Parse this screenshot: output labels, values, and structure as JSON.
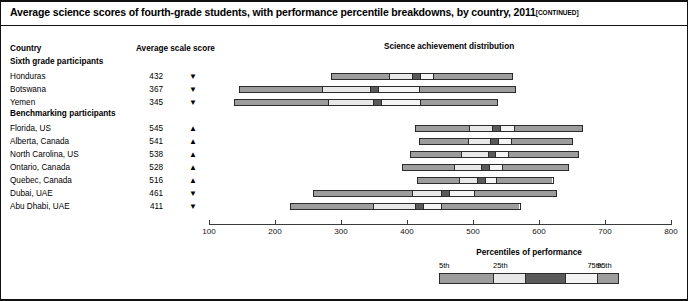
{
  "title": {
    "main": "Average science scores of fourth-grade students, with performance percentile breakdowns, by country, 2011",
    "continued": "[CONTINUED]"
  },
  "columns": {
    "country": "Country",
    "score": "Average scale score",
    "distribution": "Science achievement distribution"
  },
  "groups": [
    {
      "label": "Sixth grade participants"
    },
    {
      "label": "Benchmarking participants"
    }
  ],
  "legend": {
    "title": "Percentiles of performance",
    "labels": [
      "5th",
      "25th",
      "75th",
      "95th"
    ],
    "colors": [
      "#9d9d9d",
      "#e8e8e8",
      "#5a5a5a",
      "#f4f4f4",
      "#9d9d9d"
    ]
  },
  "arrows": {
    "up": "▲",
    "down": "▼"
  },
  "chart_data": {
    "type": "bar",
    "title": "Science achievement distribution",
    "xlabel": "",
    "ylabel": "",
    "xlim": [
      100,
      800
    ],
    "xticks": [
      100,
      200,
      300,
      400,
      500,
      600,
      700,
      800
    ],
    "grid": false,
    "legend_position": "bottom-right",
    "series_note": "Each row is a percentile range bar: 5th, 25th, 75th, 95th percentile boundaries around the average scale score.",
    "rows": [
      {
        "group": "Sixth grade participants",
        "country": "Honduras",
        "score": 432,
        "arrow": "down",
        "p5": 285,
        "p25": 372,
        "p50": 413,
        "p75": 440,
        "p95": 560
      },
      {
        "group": "Sixth grade participants",
        "country": "Botswana",
        "score": 367,
        "arrow": "down",
        "p5": 145,
        "p25": 270,
        "p50": 350,
        "p75": 418,
        "p95": 565
      },
      {
        "group": "Sixth grade participants",
        "country": "Yemen",
        "score": 345,
        "arrow": "down",
        "p5": 138,
        "p25": 280,
        "p50": 355,
        "p75": 420,
        "p95": 538
      },
      {
        "group": "Benchmarking participants",
        "country": "Florida, US",
        "score": 545,
        "arrow": "up",
        "p5": 412,
        "p25": 494,
        "p50": 535,
        "p75": 562,
        "p95": 667
      },
      {
        "group": "Benchmarking participants",
        "country": "Alberta, Canada",
        "score": 541,
        "arrow": "up",
        "p5": 418,
        "p25": 492,
        "p50": 532,
        "p75": 558,
        "p95": 652
      },
      {
        "group": "Benchmarking participants",
        "country": "North Carolina, US",
        "score": 538,
        "arrow": "up",
        "p5": 404,
        "p25": 482,
        "p50": 528,
        "p75": 554,
        "p95": 660
      },
      {
        "group": "Benchmarking participants",
        "country": "Ontario, Canada",
        "score": 528,
        "arrow": "up",
        "p5": 392,
        "p25": 470,
        "p50": 518,
        "p75": 545,
        "p95": 645
      },
      {
        "group": "Benchmarking participants",
        "country": "Quebec, Canada",
        "score": 516,
        "arrow": "up",
        "p5": 415,
        "p25": 478,
        "p50": 512,
        "p75": 535,
        "p95": 622
      },
      {
        "group": "Benchmarking participants",
        "country": "Dubai, UAE",
        "score": 461,
        "arrow": "down",
        "p5": 258,
        "p25": 408,
        "p50": 458,
        "p75": 502,
        "p95": 628
      },
      {
        "group": "Benchmarking participants",
        "country": "Abu Dhabi, UAE",
        "score": 411,
        "arrow": "down",
        "p5": 222,
        "p25": 348,
        "p50": 418,
        "p75": 452,
        "p95": 572
      }
    ]
  }
}
